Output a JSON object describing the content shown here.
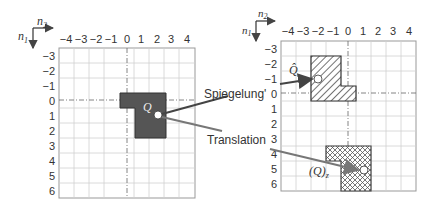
{
  "axes": {
    "n1_label": "n",
    "n1_sub": "1",
    "n2_label": "n",
    "n2_sub": "2"
  },
  "grid": {
    "col_ticks": [
      "−4",
      "−3",
      "−2",
      "−1",
      "0",
      "1",
      "2",
      "3",
      "4"
    ],
    "row_ticks": [
      "−3",
      "−2",
      "−1",
      "0",
      "1",
      "2",
      "3",
      "4",
      "5",
      "6"
    ]
  },
  "labels": {
    "original": "Q",
    "reflected": "Q̂",
    "translated_main": "(Q)",
    "translated_sub": "z",
    "reflection": "Spiegelung",
    "reflection_suffix": "'",
    "translation": "Translation"
  },
  "colors": {
    "shape_fill": "#555555",
    "grid_line": "#c8c8c8",
    "border": "#888888",
    "arrow": "#555555",
    "arrow2": "#777777"
  }
}
